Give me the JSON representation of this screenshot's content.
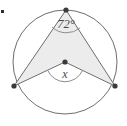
{
  "figure": {
    "kind": "circle-geometry-diagram",
    "width": 127,
    "height": 126,
    "background_color": "#ffffff"
  },
  "colors": {
    "stroke": "#6e6e6e",
    "stroke_light": "#8d8d8d",
    "shade_fill": "#ececed",
    "vertex_dot": "#3a3a3a",
    "label_text": "#4a4a4a",
    "circle_fill": "#ffffff",
    "artifact": "#2e2e2e"
  },
  "circle": {
    "center_x": 65,
    "center_y": 62,
    "radius": 52,
    "fill": "#ffffff",
    "stroke_width": 1
  },
  "points": {
    "apex": {
      "label": "",
      "x": 66,
      "y": 10
    },
    "left": {
      "label": "",
      "x": 14,
      "y": 86
    },
    "right": {
      "label": "",
      "x": 115,
      "y": 86
    },
    "center": {
      "label": "",
      "x": 65,
      "y": 62
    }
  },
  "shaded_region": {
    "description": "Region bounded by chords from apex to left and right vertices and by the radii meeting at the center",
    "fill": "#ececed"
  },
  "angles": [
    {
      "name": "inscribed-angle",
      "vertex": "apex",
      "value": "72",
      "unit": "°",
      "display": "72°",
      "arc_radius": 21
    },
    {
      "name": "central-angle",
      "vertex": "center",
      "value": "x",
      "unit": "",
      "display": "x",
      "arc_radius": 19
    }
  ],
  "segments": [
    {
      "name": "chord-apex-left",
      "from": "apex",
      "to": "left"
    },
    {
      "name": "chord-apex-right",
      "from": "apex",
      "to": "right"
    },
    {
      "name": "radius-center-left",
      "from": "center",
      "to": "left"
    },
    {
      "name": "radius-center-right",
      "from": "center",
      "to": "right"
    },
    {
      "name": "segment-apex-center",
      "from": "apex",
      "to": "center"
    }
  ],
  "artifact": {
    "name": "stray-pixel-mark",
    "x": 1,
    "y": 10,
    "size": 3
  }
}
